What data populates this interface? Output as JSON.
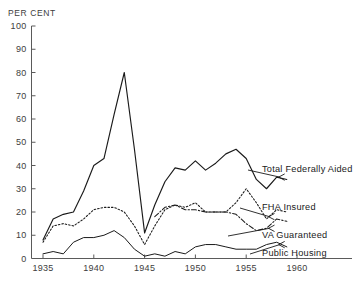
{
  "chart_data": {
    "type": "line",
    "title": "",
    "subtitle": "",
    "ylabel": "PER CENT",
    "xlabel": "",
    "xlim": [
      1934,
      1961
    ],
    "ylim": [
      0,
      100
    ],
    "grid": false,
    "legend_position": "right-inline-annotations",
    "ytick_labels": [
      "0",
      "10",
      "20",
      "30",
      "40",
      "50",
      "60",
      "70",
      "80",
      "90",
      "100"
    ],
    "yticks": [
      0,
      10,
      20,
      30,
      40,
      50,
      60,
      70,
      80,
      90,
      100
    ],
    "xtick_labels": [
      "1935",
      "1940",
      "1945",
      "1950",
      "1955",
      "1960"
    ],
    "xticks": [
      1935,
      1940,
      1945,
      1950,
      1955,
      1960
    ],
    "x": [
      1935,
      1936,
      1937,
      1938,
      1939,
      1940,
      1941,
      1942,
      1943,
      1944,
      1945,
      1946,
      1947,
      1948,
      1949,
      1950,
      1951,
      1952,
      1953,
      1954,
      1955,
      1956,
      1957,
      1958,
      1959
    ],
    "series": [
      {
        "name": "Total Federally Aided",
        "style": "solid",
        "values": [
          8,
          17,
          19,
          20,
          29,
          40,
          43,
          62,
          80,
          47,
          11,
          23,
          33,
          39,
          38,
          42,
          38,
          41,
          45,
          47,
          43,
          34,
          30,
          35,
          34
        ]
      },
      {
        "name": "FHA Insured",
        "style": "dotted",
        "values": [
          7,
          14,
          15,
          14,
          17,
          21,
          22,
          22,
          20,
          14,
          6,
          14,
          21,
          23,
          22,
          24,
          20,
          20,
          20,
          24,
          30,
          24,
          17,
          21,
          20
        ]
      },
      {
        "name": "VA Guaranteed",
        "style": "dash-dot",
        "values": [
          0,
          0,
          0,
          0,
          0,
          0,
          0,
          0,
          0,
          0,
          0,
          18,
          22,
          23,
          21,
          21,
          20,
          20,
          20,
          19,
          15,
          12,
          13,
          17,
          16
        ]
      },
      {
        "name": "Public Housing",
        "style": "solid-thin",
        "values": [
          2,
          3,
          2,
          7,
          9,
          9,
          10,
          12,
          9,
          4,
          1,
          2,
          1,
          3,
          2,
          5,
          6,
          6,
          5,
          4,
          4,
          4,
          6,
          7,
          5
        ]
      }
    ],
    "annotations": [
      {
        "label": "Total Federally Aided",
        "points_to_year": 1958,
        "points_to_value": 35
      },
      {
        "label": "FHA Insured",
        "points_to_year": 1957,
        "points_to_value": 18
      },
      {
        "label": "VA Guaranteed",
        "points_to_year": 1957,
        "points_to_value": 13
      },
      {
        "label": "Public Housing",
        "points_to_year": 1958,
        "points_to_value": 6
      }
    ]
  },
  "colors": {
    "background": "#ffffff",
    "ink": "#1a1a1a",
    "axis": "#5a5a5a"
  }
}
